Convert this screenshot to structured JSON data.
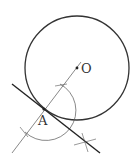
{
  "diagram": {
    "type": "geometry-construction",
    "labels": {
      "center": "O",
      "point": "A"
    },
    "circle": {
      "cx": 77,
      "cy": 68,
      "r": 52
    },
    "points": {
      "O": {
        "x": 77,
        "y": 68
      },
      "A": {
        "x": 44,
        "y": 109
      }
    },
    "radial_line": {
      "x1": 81,
      "y1": 62,
      "x2": 12,
      "y2": 153
    },
    "tangent_line": {
      "x1": 12,
      "y1": 84,
      "x2": 100,
      "y2": 153
    },
    "construction_arc": {
      "cx": 44,
      "cy": 109,
      "r": 30
    },
    "colors": {
      "stroke": "#333333",
      "background": "#ffffff"
    }
  }
}
